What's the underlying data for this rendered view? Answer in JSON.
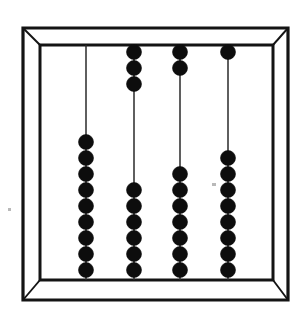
{
  "figure": {
    "bead_color": "#0d0d0d",
    "frame_color": "#141414",
    "rod_color": "#2a2a2a",
    "background_color": "#ffffff"
  },
  "frame": {
    "outer": {
      "x": 23,
      "y": 28,
      "width": 265,
      "height": 272
    },
    "inner": {
      "x": 40,
      "y": 45,
      "width": 233,
      "height": 235
    },
    "has_corner_diagonals": true,
    "perspective": "three-dimensional box with beveled corners"
  },
  "geometry": {
    "bead_diameter": 15,
    "bead_spacing": 16,
    "rod_top_y": 45,
    "rod_bottom_y": 280
  },
  "chart_data": {
    "type": "table",
    "columns": [
      "Rod",
      "Top beads",
      "Bottom beads",
      "Total"
    ],
    "categories": [
      "Rod 1",
      "Rod 2",
      "Rod 3",
      "Rod 4"
    ],
    "series": [
      {
        "name": "Top beads",
        "values": [
          0,
          3,
          2,
          1
        ]
      },
      {
        "name": "Bottom beads",
        "values": [
          9,
          6,
          7,
          8
        ]
      }
    ],
    "rows": [
      [
        "Rod 1",
        0,
        9,
        9
      ],
      [
        "Rod 2",
        3,
        6,
        9
      ],
      [
        "Rod 3",
        2,
        7,
        9
      ],
      [
        "Rod 4",
        1,
        8,
        9
      ]
    ],
    "xlabel": "Rod",
    "ylabel": "Number of beads",
    "ylim": [
      0,
      9
    ],
    "grid": false,
    "legend": "none"
  },
  "rods": [
    {
      "id": "rod-1",
      "label": "Rod 1",
      "x": 86,
      "top_beads": 0,
      "bottom_beads": 9,
      "total_beads": 9,
      "bottom_start_y": 142
    },
    {
      "id": "rod-2",
      "label": "Rod 2",
      "x": 134,
      "top_beads": 3,
      "bottom_beads": 6,
      "total_beads": 9,
      "top_start_y": 52,
      "bottom_start_y": 190
    },
    {
      "id": "rod-3",
      "label": "Rod 3",
      "x": 180,
      "top_beads": 2,
      "bottom_beads": 7,
      "total_beads": 9,
      "top_start_y": 52,
      "bottom_start_y": 174
    },
    {
      "id": "rod-4",
      "label": "Rod 4",
      "x": 228,
      "top_beads": 1,
      "bottom_beads": 8,
      "total_beads": 9,
      "top_start_y": 52,
      "bottom_start_y": 158
    }
  ],
  "specks": [
    {
      "x": 8,
      "y": 208,
      "width": 3,
      "height": 3
    },
    {
      "x": 212,
      "y": 183,
      "width": 4,
      "height": 3
    }
  ]
}
